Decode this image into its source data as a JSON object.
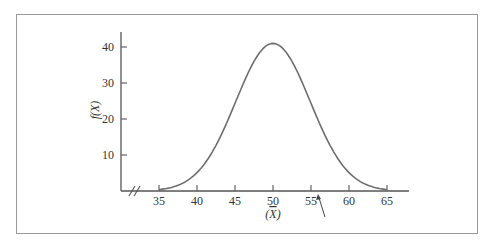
{
  "chart_data": {
    "type": "line",
    "title": "",
    "xlabel": "(X̄)",
    "ylabel": "f(X)",
    "x_ticks": [
      35,
      40,
      45,
      50,
      55,
      60,
      65
    ],
    "y_ticks": [
      10,
      20,
      30,
      40
    ],
    "xlim": [
      32,
      68
    ],
    "ylim": [
      0,
      45
    ],
    "grid": false,
    "axis_break": "x-axis break marks (//) near origin",
    "series": [
      {
        "name": "normal curve",
        "x": [
          35,
          37,
          39,
          41,
          43,
          45,
          47,
          49,
          50,
          51,
          53,
          55,
          57,
          59,
          61,
          63,
          65
        ],
        "y": [
          0.4,
          1.6,
          4.3,
          9.4,
          17.1,
          26.3,
          35.0,
          40.3,
          41.0,
          40.3,
          35.0,
          26.3,
          17.1,
          9.4,
          4.3,
          1.6,
          0.4
        ]
      }
    ],
    "annotations": [
      {
        "type": "arrow",
        "points_to_x": 56,
        "text": ""
      }
    ],
    "colors": {
      "curve": "#6e6e6e",
      "axis": "#555555",
      "frame": "#9a9a9a"
    }
  }
}
